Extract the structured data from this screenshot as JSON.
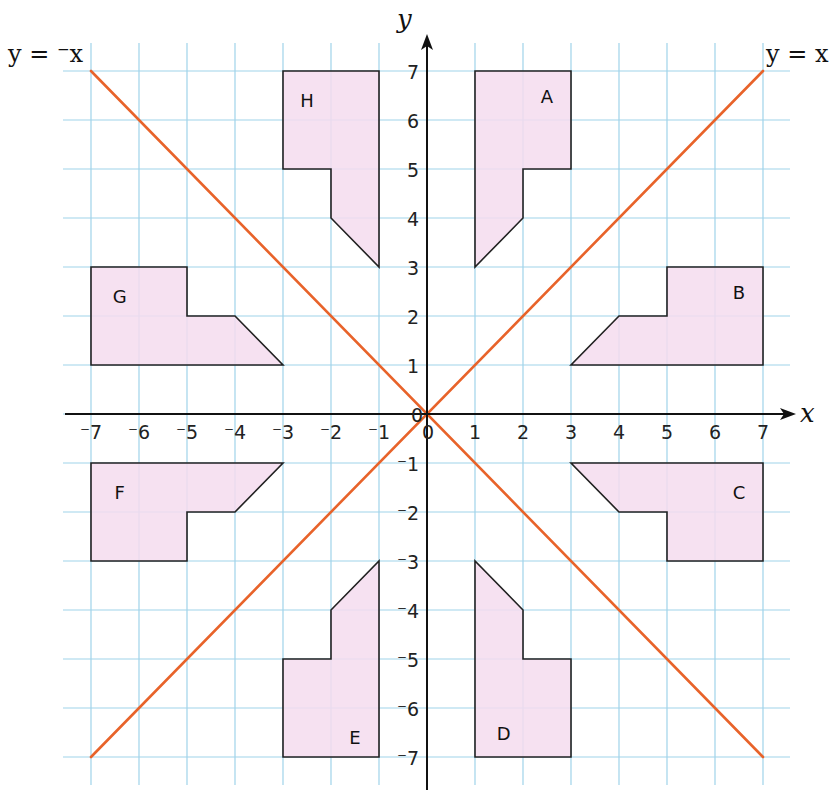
{
  "chart_data": {
    "type": "diagram",
    "axes": {
      "x_label": "x",
      "y_label": "y",
      "x_ticks": [
        -7,
        -6,
        -5,
        -4,
        -3,
        -2,
        -1,
        0,
        1,
        2,
        3,
        4,
        5,
        6,
        7
      ],
      "y_ticks": [
        -7,
        -6,
        -5,
        -4,
        -3,
        -2,
        -1,
        0,
        1,
        2,
        3,
        4,
        5,
        6,
        7
      ],
      "x_range": [
        -7,
        7
      ],
      "y_range": [
        -7,
        7
      ],
      "grid": true
    },
    "lines": [
      {
        "name": "y = x",
        "label": "y = x",
        "from": [
          -7,
          -7
        ],
        "to": [
          7,
          7
        ],
        "color": "#e8632a"
      },
      {
        "name": "y = -x",
        "label": "y = ⁻x",
        "from": [
          -7,
          7
        ],
        "to": [
          7,
          -7
        ],
        "color": "#e8632a"
      }
    ],
    "shapes": [
      {
        "name": "A",
        "label_pos": [
          2.5,
          6.5
        ],
        "vertices": [
          [
            1,
            7
          ],
          [
            3,
            7
          ],
          [
            3,
            5
          ],
          [
            2,
            5
          ],
          [
            2,
            4
          ],
          [
            1,
            3
          ]
        ]
      },
      {
        "name": "B",
        "label_pos": [
          6.5,
          2.5
        ],
        "vertices": [
          [
            7,
            1
          ],
          [
            7,
            3
          ],
          [
            5,
            3
          ],
          [
            5,
            2
          ],
          [
            4,
            2
          ],
          [
            3,
            1
          ]
        ]
      },
      {
        "name": "C",
        "label_pos": [
          6.5,
          -1.6
        ],
        "vertices": [
          [
            7,
            -1
          ],
          [
            7,
            -3
          ],
          [
            5,
            -3
          ],
          [
            5,
            -2
          ],
          [
            4,
            -2
          ],
          [
            3,
            -1
          ]
        ]
      },
      {
        "name": "D",
        "label_pos": [
          1.6,
          -6.5
        ],
        "vertices": [
          [
            1,
            -7
          ],
          [
            3,
            -7
          ],
          [
            3,
            -5
          ],
          [
            2,
            -5
          ],
          [
            2,
            -4
          ],
          [
            1,
            -3
          ]
        ]
      },
      {
        "name": "E",
        "label_pos": [
          -1.5,
          -6.6
        ],
        "vertices": [
          [
            -1,
            -7
          ],
          [
            -3,
            -7
          ],
          [
            -3,
            -5
          ],
          [
            -2,
            -5
          ],
          [
            -2,
            -4
          ],
          [
            -1,
            -3
          ]
        ]
      },
      {
        "name": "F",
        "label_pos": [
          -6.4,
          -1.6
        ],
        "vertices": [
          [
            -7,
            -1
          ],
          [
            -7,
            -3
          ],
          [
            -5,
            -3
          ],
          [
            -5,
            -2
          ],
          [
            -4,
            -2
          ],
          [
            -3,
            -1
          ]
        ]
      },
      {
        "name": "G",
        "label_pos": [
          -6.4,
          2.4
        ],
        "vertices": [
          [
            -7,
            1
          ],
          [
            -7,
            3
          ],
          [
            -5,
            3
          ],
          [
            -5,
            2
          ],
          [
            -4,
            2
          ],
          [
            -3,
            1
          ]
        ]
      },
      {
        "name": "H",
        "label_pos": [
          -2.5,
          6.4
        ],
        "vertices": [
          [
            -1,
            7
          ],
          [
            -3,
            7
          ],
          [
            -3,
            5
          ],
          [
            -2,
            5
          ],
          [
            -2,
            4
          ],
          [
            -1,
            3
          ]
        ]
      }
    ]
  },
  "labels": {
    "x_axis": "x",
    "y_axis": "y",
    "line_y_eq_x": "y = x",
    "line_y_eq_neg_x": "y = ⁻x"
  },
  "colors": {
    "grid": "#9fd3ea",
    "axis": "#111111",
    "line": "#e8632a",
    "shape_fill": "#f4dcef",
    "shape_stroke": "#222222"
  }
}
